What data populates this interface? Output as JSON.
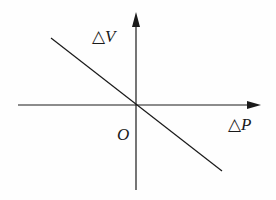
{
  "diagram": {
    "y_axis_label": {
      "delta": "△",
      "var": "V"
    },
    "x_axis_label": {
      "delta": "△",
      "var": "P"
    },
    "origin_label": "O",
    "line": {
      "from": [
        51,
        38
      ],
      "to": [
        222,
        171
      ],
      "description": "straight line with negative slope passing through origin"
    },
    "colors": {
      "stroke": "#1a1a1a",
      "background": "#fefefe"
    }
  }
}
